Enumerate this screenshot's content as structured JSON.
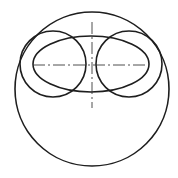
{
  "diagram": {
    "type": "technical-drawing",
    "background": "#ffffff",
    "stroke_color": "#1e1e1e",
    "centerline_color": "#3a3a3a",
    "shapes": [
      {
        "name": "outer-circle",
        "kind": "circle",
        "cx": 92,
        "cy": 89,
        "r": 77
      },
      {
        "name": "central-ellipse",
        "kind": "ellipse",
        "cx": 91,
        "cy": 64,
        "rx": 58,
        "ry": 28
      },
      {
        "name": "left-circle",
        "kind": "circle",
        "cx": 53,
        "cy": 64,
        "r": 33
      },
      {
        "name": "right-circle",
        "kind": "circle",
        "cx": 129,
        "cy": 64,
        "r": 33
      }
    ],
    "centerlines": [
      {
        "name": "horizontal-centerline",
        "x1": 33,
        "y1": 65,
        "x2": 149,
        "y2": 65
      },
      {
        "name": "vertical-centerline",
        "x1": 92,
        "y1": 22,
        "x2": 92,
        "y2": 108
      }
    ]
  }
}
